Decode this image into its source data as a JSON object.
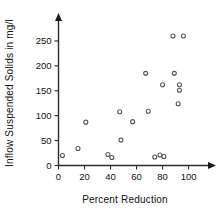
{
  "chart_data": {
    "type": "scatter",
    "title": "",
    "xlabel": "Percent Reduction",
    "ylabel": "Inflow Suspended Solids in mg/l",
    "xlim": [
      0,
      108
    ],
    "ylim": [
      0,
      280
    ],
    "xticks": [
      0,
      20,
      40,
      60,
      80,
      100
    ],
    "xtick_labels": [
      "0",
      "20",
      "40",
      "60",
      "80",
      "100"
    ],
    "yticks": [
      0,
      50,
      100,
      150,
      200,
      250
    ],
    "ytick_labels": [
      "0",
      "50",
      "100",
      "150",
      "200",
      "250"
    ],
    "grid": false,
    "legend": null,
    "marker": "open-circle",
    "marker_color": "#565656",
    "axis_color": "#2b2b2b",
    "points": [
      {
        "x": 3,
        "y": 20
      },
      {
        "x": 15,
        "y": 34
      },
      {
        "x": 21,
        "y": 87
      },
      {
        "x": 38,
        "y": 22
      },
      {
        "x": 41,
        "y": 16
      },
      {
        "x": 47,
        "y": 108
      },
      {
        "x": 48,
        "y": 51
      },
      {
        "x": 57,
        "y": 88
      },
      {
        "x": 67,
        "y": 185
      },
      {
        "x": 69,
        "y": 109
      },
      {
        "x": 74,
        "y": 17
      },
      {
        "x": 78,
        "y": 21
      },
      {
        "x": 81,
        "y": 18
      },
      {
        "x": 80,
        "y": 162
      },
      {
        "x": 88,
        "y": 260
      },
      {
        "x": 89,
        "y": 185
      },
      {
        "x": 92,
        "y": 124
      },
      {
        "x": 93,
        "y": 162
      },
      {
        "x": 93,
        "y": 151
      },
      {
        "x": 96,
        "y": 260
      }
    ]
  },
  "axes": {
    "y_title": "Inflow Suspended Solids in mg/l",
    "x_title": "Percent Reduction"
  }
}
